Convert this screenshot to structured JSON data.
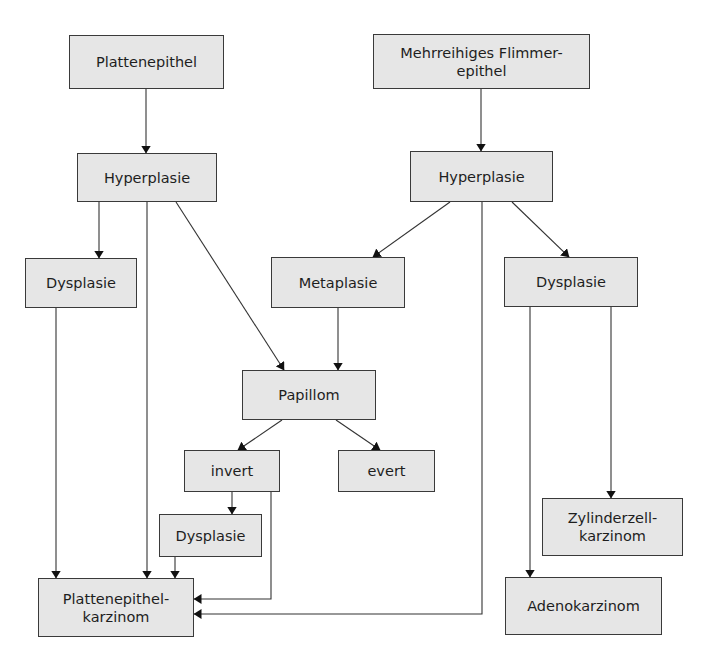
{
  "diagram": {
    "colors": {
      "node_fill": "#e6e6e6",
      "node_border": "#3a3a3a",
      "edge": "#333333",
      "text": "#1e1e1e"
    },
    "nodes": {
      "plattenepithel": {
        "label": "Plattenepithel",
        "x": 69,
        "y": 35,
        "w": 155,
        "h": 54
      },
      "flimmerepithel": {
        "label": "Mehrreihiges Flimmer-\nepithel",
        "x": 373,
        "y": 34,
        "w": 217,
        "h": 55
      },
      "hyperplasie_left": {
        "label": "Hyperplasie",
        "x": 77,
        "y": 153,
        "w": 140,
        "h": 49
      },
      "hyperplasie_right": {
        "label": "Hyperplasie",
        "x": 410,
        "y": 151,
        "w": 143,
        "h": 51
      },
      "dysplasie_left": {
        "label": "Dysplasie",
        "x": 25,
        "y": 258,
        "w": 112,
        "h": 50
      },
      "metaplasie": {
        "label": "Metaplasie",
        "x": 271,
        "y": 257,
        "w": 134,
        "h": 51
      },
      "dysplasie_right": {
        "label": "Dysplasie",
        "x": 504,
        "y": 257,
        "w": 134,
        "h": 50
      },
      "papillom": {
        "label": "Papillom",
        "x": 242,
        "y": 370,
        "w": 134,
        "h": 50
      },
      "invert": {
        "label": "invert",
        "x": 184,
        "y": 450,
        "w": 96,
        "h": 42
      },
      "evert": {
        "label": "evert",
        "x": 338,
        "y": 450,
        "w": 97,
        "h": 42
      },
      "dysplasie_small": {
        "label": "Dysplasie",
        "x": 159,
        "y": 514,
        "w": 103,
        "h": 43
      },
      "zylinderzellkarzinom": {
        "label": "Zylinderzell-\nkarzinom",
        "x": 542,
        "y": 498,
        "w": 141,
        "h": 58
      },
      "plattenepithelkarzinom": {
        "label": "Plattenepithel-\nkarzinom",
        "x": 38,
        "y": 578,
        "w": 156,
        "h": 59
      },
      "adenokarzinom": {
        "label": "Adenokarzinom",
        "x": 505,
        "y": 577,
        "w": 157,
        "h": 58
      }
    },
    "edges": [
      {
        "from": "plattenepithel",
        "to": "hyperplasie_left",
        "points": [
          [
            146,
            89
          ],
          [
            146,
            153
          ]
        ]
      },
      {
        "from": "flimmerepithel",
        "to": "hyperplasie_right",
        "points": [
          [
            481,
            89
          ],
          [
            481,
            151
          ]
        ]
      },
      {
        "from": "hyperplasie_left",
        "to": "dysplasie_left",
        "points": [
          [
            99,
            202
          ],
          [
            99,
            258
          ]
        ]
      },
      {
        "from": "hyperplasie_left",
        "to": "plattenepithelkarzinom",
        "points": [
          [
            147,
            202
          ],
          [
            147,
            578
          ]
        ]
      },
      {
        "from": "hyperplasie_left",
        "to": "papillom",
        "points": [
          [
            176,
            202
          ],
          [
            284,
            370
          ]
        ]
      },
      {
        "from": "hyperplasie_right",
        "to": "metaplasie",
        "points": [
          [
            450,
            202
          ],
          [
            373,
            257
          ]
        ]
      },
      {
        "from": "hyperplasie_right",
        "to": "dysplasie_right",
        "points": [
          [
            512,
            202
          ],
          [
            569,
            257
          ]
        ]
      },
      {
        "from": "hyperplasie_right",
        "to": "plattenepithelkarzinom",
        "points": [
          [
            482,
            202
          ],
          [
            482,
            614
          ],
          [
            194,
            614
          ]
        ]
      },
      {
        "from": "dysplasie_left",
        "to": "plattenepithelkarzinom",
        "points": [
          [
            56,
            308
          ],
          [
            56,
            578
          ]
        ]
      },
      {
        "from": "metaplasie",
        "to": "papillom",
        "points": [
          [
            338,
            308
          ],
          [
            338,
            370
          ]
        ]
      },
      {
        "from": "papillom",
        "to": "invert",
        "points": [
          [
            282,
            420
          ],
          [
            238,
            450
          ]
        ]
      },
      {
        "from": "papillom",
        "to": "evert",
        "points": [
          [
            336,
            420
          ],
          [
            380,
            450
          ]
        ]
      },
      {
        "from": "invert",
        "to": "dysplasie_small",
        "points": [
          [
            232,
            492
          ],
          [
            232,
            514
          ]
        ]
      },
      {
        "from": "invert",
        "to": "plattenepithelkarzinom",
        "points": [
          [
            271,
            492
          ],
          [
            271,
            599
          ],
          [
            194,
            599
          ]
        ]
      },
      {
        "from": "dysplasie_small",
        "to": "plattenepithelkarzinom",
        "points": [
          [
            175,
            557
          ],
          [
            175,
            578
          ]
        ]
      },
      {
        "from": "dysplasie_right",
        "to": "adenokarzinom",
        "points": [
          [
            530,
            307
          ],
          [
            530,
            577
          ]
        ]
      },
      {
        "from": "dysplasie_right",
        "to": "zylinderzellkarzinom",
        "points": [
          [
            611,
            307
          ],
          [
            611,
            498
          ]
        ]
      }
    ]
  }
}
